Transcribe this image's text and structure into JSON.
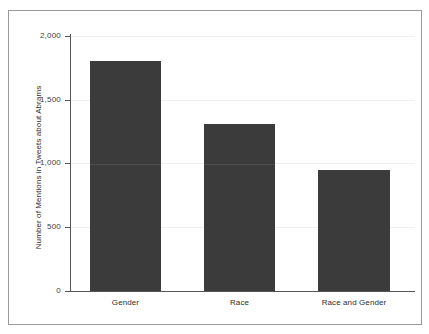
{
  "figure": {
    "background_color": "#ffffff",
    "frame_color": "#9a9a9a",
    "bar_color": "#3b3b3b",
    "axis_color": "#555555",
    "text_color": "#2e2e2e"
  },
  "chart_data": {
    "type": "bar",
    "title": "",
    "subtitle": "",
    "xlabel": "",
    "ylabel": "Number of Mentions in Tweets about Abrams",
    "categories": [
      "Gender",
      "Race",
      "Race and Gender"
    ],
    "values": [
      1800,
      1310,
      950
    ],
    "series": [
      {
        "name": "Mentions",
        "values": [
          1800,
          1310,
          950
        ]
      }
    ],
    "ylim": [
      0,
      2000
    ],
    "yticks": [
      0,
      500,
      1000,
      1500,
      2000
    ],
    "ytick_labels": [
      "0",
      "500",
      "1,000",
      "1,500",
      "2,000"
    ],
    "grid": false,
    "legend": null,
    "legend_position": "none",
    "annotations": []
  }
}
